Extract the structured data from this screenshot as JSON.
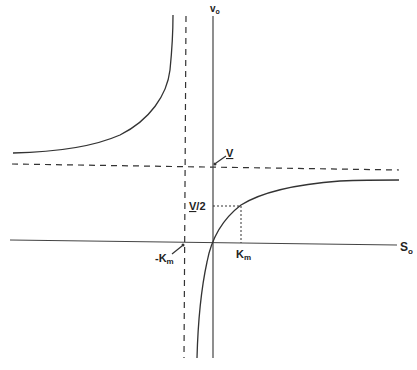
{
  "diagram": {
    "title": "",
    "colors": {
      "line": "#333333",
      "background": "#ffffff"
    },
    "axes": {
      "y_label_main": "v",
      "y_label_sub": "o",
      "x_label_main": "S",
      "x_label_sub": "o"
    },
    "labels": {
      "vmax_main": "V",
      "half_vmax_main": "V",
      "half_vmax_suffix": "/2",
      "km_main": "K",
      "km_sub": "m",
      "neg_km_prefix": "-K",
      "neg_km_sub": "m"
    },
    "asymptotes": {
      "horizontal": "v = V (dashed)",
      "vertical": "S = -Km (dashed)"
    }
  }
}
